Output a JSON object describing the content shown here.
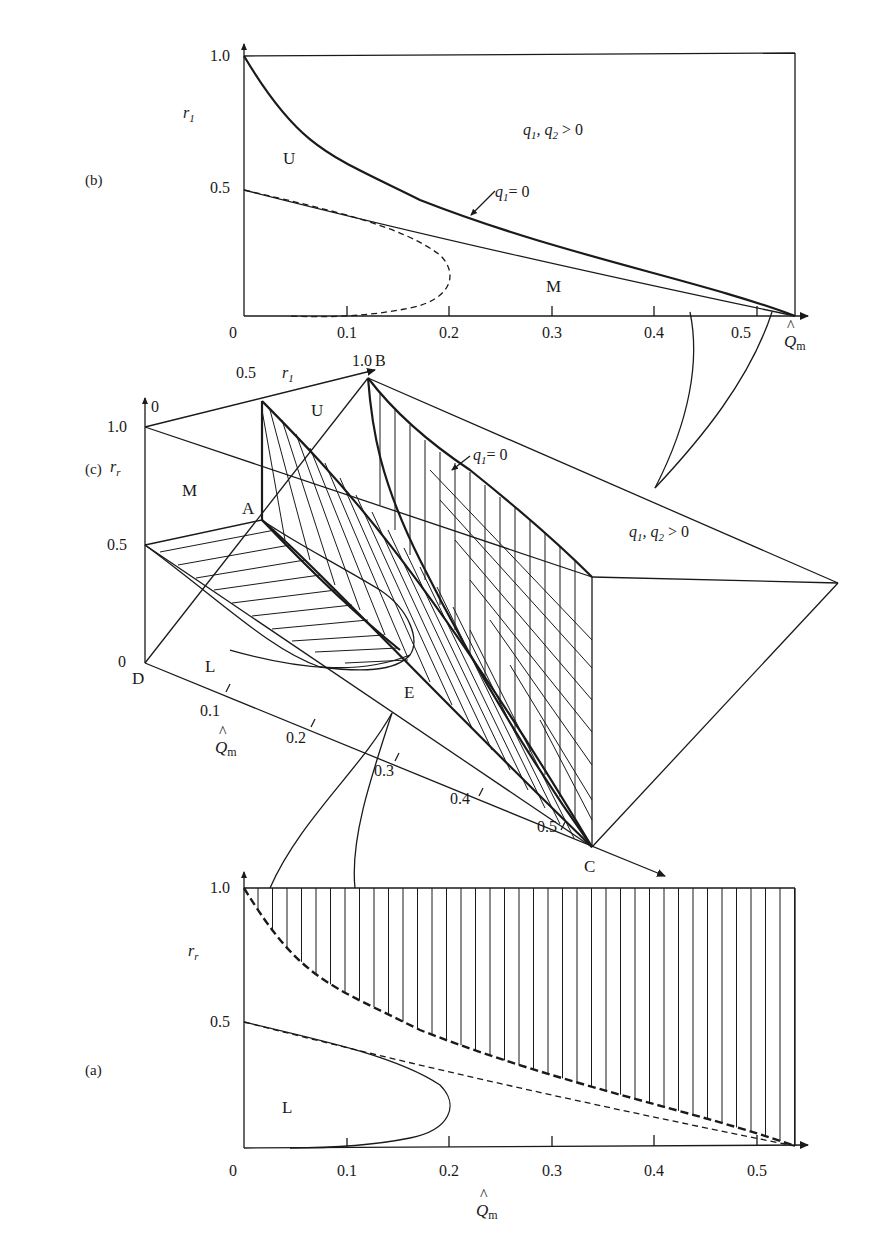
{
  "figure": {
    "panels": [
      {
        "id": "b",
        "label": "(b)"
      },
      {
        "id": "c",
        "label": "(c)"
      },
      {
        "id": "a",
        "label": "(a)"
      }
    ]
  },
  "chart_data": [
    {
      "panel": "(b)",
      "type": "line",
      "title": "",
      "xlabel": "Q̂m",
      "ylabel": "r1",
      "xlim": [
        0,
        0.55
      ],
      "ylim": [
        0,
        1.0
      ],
      "x_ticks": [
        "0",
        "0.1",
        "0.2",
        "0.3",
        "0.4",
        "0.5"
      ],
      "y_ticks": [
        "0.5",
        "1.0"
      ],
      "grid": false,
      "region_labels": [
        "U",
        "M",
        "q1, q2 > 0"
      ],
      "annotations": [
        "q1 = 0"
      ],
      "series": [
        {
          "name": "q1 = 0 (upper boundary)",
          "style": "solid-thick",
          "x": [
            0,
            0.05,
            0.1,
            0.2,
            0.3,
            0.4,
            0.5,
            0.54
          ],
          "y": [
            1.0,
            0.82,
            0.7,
            0.51,
            0.35,
            0.2,
            0.05,
            0.0
          ]
        },
        {
          "name": "lower boundary U/M",
          "style": "solid",
          "x": [
            0,
            0.1,
            0.2,
            0.3,
            0.4,
            0.5,
            0.54
          ],
          "y": [
            0.5,
            0.39,
            0.28,
            0.18,
            0.1,
            0.03,
            0.0
          ]
        },
        {
          "name": "L boundary (projected)",
          "style": "dashed",
          "x": [
            0,
            0.1,
            0.2,
            0.25,
            0.2,
            0.1,
            0.05
          ],
          "y": [
            0.5,
            0.39,
            0.27,
            0.16,
            0.05,
            0.01,
            0.0
          ]
        }
      ]
    },
    {
      "panel": "(c)",
      "type": "line",
      "title": "3-D region diagram",
      "axes": {
        "x": "Q̂m",
        "y": "r1",
        "z": "rr"
      },
      "x_ticks": [
        "0.1",
        "0.2",
        "0.3",
        "0.4",
        "0.5"
      ],
      "y_ticks": [
        "0",
        "0.5",
        "1.0"
      ],
      "z_ticks": [
        "0",
        "0.5",
        "1.0"
      ],
      "points": [
        "A",
        "B",
        "C",
        "D",
        "E"
      ],
      "region_labels": [
        "U",
        "M",
        "L",
        "q1, q2 > 0"
      ],
      "annotations": [
        "q1 = 0"
      ]
    },
    {
      "panel": "(a)",
      "type": "line",
      "title": "",
      "xlabel": "Q̂m",
      "ylabel": "rr",
      "xlim": [
        0,
        0.55
      ],
      "ylim": [
        0,
        1.0
      ],
      "x_ticks": [
        "0",
        "0.1",
        "0.2",
        "0.3",
        "0.4",
        "0.5"
      ],
      "y_ticks": [
        "0.5",
        "1.0"
      ],
      "grid": false,
      "region_labels": [
        "L"
      ],
      "series": [
        {
          "name": "upper dashed boundary (hatched above)",
          "style": "dashed-thick",
          "x": [
            0,
            0.05,
            0.1,
            0.2,
            0.3,
            0.4,
            0.5,
            0.54
          ],
          "y": [
            1.0,
            0.82,
            0.7,
            0.51,
            0.35,
            0.2,
            0.05,
            0.0
          ]
        },
        {
          "name": "lower dashed boundary",
          "style": "dashed",
          "x": [
            0,
            0.1,
            0.2,
            0.3,
            0.4,
            0.5,
            0.54
          ],
          "y": [
            0.5,
            0.39,
            0.28,
            0.18,
            0.1,
            0.03,
            0.0
          ]
        },
        {
          "name": "L region boundary",
          "style": "solid",
          "x": [
            0,
            0.1,
            0.2,
            0.25,
            0.2,
            0.1
          ],
          "y": [
            0.5,
            0.39,
            0.27,
            0.16,
            0.05,
            0.0
          ]
        }
      ]
    }
  ],
  "labels": {
    "b": {
      "panel": "(b)",
      "y_axis": "r",
      "y_sub": "1",
      "y1": "1.0",
      "y05": "0.5",
      "x0": "0",
      "x_ticks": [
        "0.1",
        "0.2",
        "0.3",
        "0.4",
        "0.5"
      ],
      "x_axis": "Q",
      "x_sub": "m",
      "hat": "^",
      "U": "U",
      "M": "M",
      "q_region": "q",
      "q_region_sub1": "1",
      "q_region_mid": ", q",
      "q_region_sub2": "2",
      "q_region_end": " > 0",
      "q1zero": "q",
      "q1zero_sub": "1",
      "q1zero_end": "= 0"
    },
    "c": {
      "panel": "(c)",
      "r1_05": "0.5",
      "r1_axis": "r",
      "r1_sub": "1",
      "r1_10": "1.0",
      "B": "B",
      "z0": "0",
      "z10": "1.0",
      "z_axis": "r",
      "z_sub": "r",
      "z05": "0.5",
      "z00": "0",
      "M": "M",
      "A": "A",
      "U": "U",
      "D": "D",
      "L": "L",
      "E": "E",
      "C": "C",
      "x_ticks": [
        "0.1",
        "0.2",
        "0.3",
        "0.4",
        "0.5"
      ],
      "x_axis": "Q",
      "x_sub": "m",
      "hat": "^",
      "q1zero": "q",
      "q1zero_sub": "1",
      "q1zero_end": "= 0",
      "q_region": "q",
      "q_region_sub1": "1",
      "q_region_mid": ", q",
      "q_region_sub2": "2",
      "q_region_end": " > 0"
    },
    "a": {
      "panel": "(a)",
      "y_axis": "r",
      "y_sub": "r",
      "y1": "1.0",
      "y05": "0.5",
      "x0": "0",
      "x_ticks": [
        "0.1",
        "0.2",
        "0.3",
        "0.4",
        "0.5"
      ],
      "x_axis": "Q",
      "x_sub": "m",
      "hat": "^",
      "L": "L"
    }
  }
}
